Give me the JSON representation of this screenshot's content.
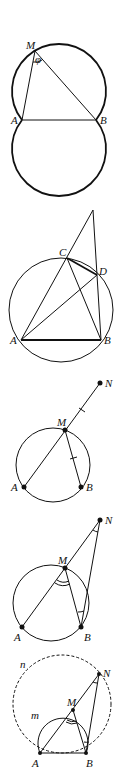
{
  "figures": [
    {
      "id": "fig1",
      "description": "Two circles through A and B with inscribed angle phi at M",
      "labels": {
        "M": "M",
        "A": "A",
        "B": "B",
        "phi": "φ"
      }
    },
    {
      "id": "fig2",
      "description": "Circle with points A, B, C, D; lines AC and BD extended meet above",
      "labels": {
        "A": "A",
        "B": "B",
        "C": "C",
        "D": "D"
      }
    },
    {
      "id": "fig3",
      "description": "Circle with A, M, B; segment AM extended to N with MN = MB",
      "labels": {
        "A": "A",
        "B": "B",
        "M": "M",
        "N": "N"
      }
    },
    {
      "id": "fig4",
      "description": "Triangle MBN isosceles; angle AMB double-marked, angles at N and B marked",
      "labels": {
        "A": "A",
        "B": "B",
        "M": "M",
        "N": "N"
      }
    },
    {
      "id": "fig5",
      "description": "Arc m through A, M, B and dashed circle n through A, N, B",
      "labels": {
        "A": "A",
        "B": "B",
        "M": "M",
        "N": "N",
        "m": "m",
        "n": "n"
      }
    }
  ],
  "colors": {
    "ink": "#111111",
    "background": "#ffffff"
  }
}
